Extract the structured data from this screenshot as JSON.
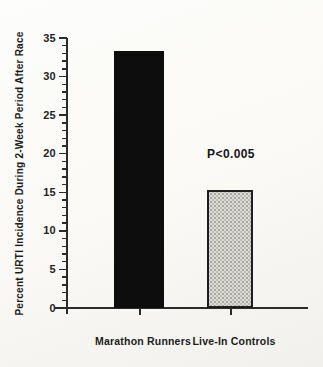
{
  "chart_data": {
    "type": "bar",
    "title": "",
    "categories": [
      "Marathon Runners",
      "Live-In Controls"
    ],
    "values": [
      33.3,
      15.3
    ],
    "bar_styles": [
      "solid-black",
      "stippled-gray"
    ],
    "annotation": {
      "text": "P<0.005",
      "near_category": "Live-In Controls"
    },
    "xlabel": "",
    "ylabel": "Percent URTI Incidence During 2-Week Period After Race",
    "ylim": [
      0,
      35
    ],
    "ytick_major_step": 5,
    "ytick_minor_step": 1,
    "ytick_labels": [
      "0",
      "5",
      "10",
      "15",
      "20",
      "25",
      "30",
      "35"
    ],
    "grid": false,
    "legend": null
  },
  "colors": {
    "bar_solid": "#0d0d0d",
    "bar_stipple_fill": "#dcdbd5",
    "bar_stipple_dot": "#93928b",
    "bar_stipple_border": "#1f1f1f",
    "axis": "#2b2b2b",
    "text": "#1a1a1a",
    "background": "#faf9f6"
  }
}
